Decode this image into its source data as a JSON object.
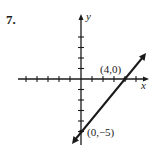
{
  "problem_number": "7.",
  "colors": {
    "ink": "#1a1a1a",
    "background": "#ffffff"
  },
  "chart_data": {
    "type": "line",
    "title": "",
    "xlabel": "x",
    "ylabel": "y",
    "xlim": [
      -5,
      6
    ],
    "ylim": [
      -6,
      6
    ],
    "x_ticks": [
      -5,
      -4,
      -3,
      -2,
      -1,
      1,
      2,
      3,
      4,
      5
    ],
    "y_ticks": [
      -5,
      -4,
      -3,
      -2,
      -1,
      1,
      2,
      3,
      4
    ],
    "grid": false,
    "series": [
      {
        "name": "line",
        "equation": "y = (5/4)x - 5",
        "x": [
          0,
          4
        ],
        "y": [
          -5,
          0
        ]
      }
    ],
    "annotations": [
      {
        "text": "(4,0)",
        "x": 4,
        "y": 0
      },
      {
        "text": "(0,−5)",
        "x": 0,
        "y": -5
      }
    ]
  },
  "labels": {
    "point_x_intercept": "(4,0)",
    "point_y_intercept": "(0,−5)",
    "x_axis": "x",
    "y_axis": "y"
  }
}
